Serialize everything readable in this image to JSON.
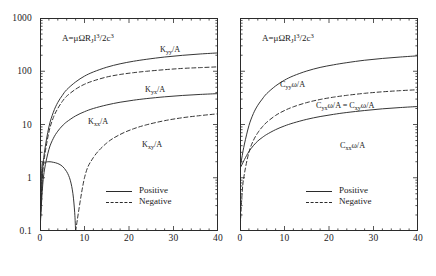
{
  "figure": {
    "annotation": {
      "prefix": "A=",
      "body": "μΩR",
      "sub1": "J",
      "var": "l",
      "sup1": "3",
      "mid": "/2c",
      "sup2": "3",
      "full": "A=μΩR_J l^3/2c^3"
    }
  },
  "axes": {
    "y_ticks": [
      "1000",
      "100",
      "10",
      "1",
      "0.1"
    ],
    "y_values": [
      1000,
      100,
      10,
      1,
      0.1
    ],
    "x_ticks": [
      "0",
      "10",
      "20",
      "30",
      "40"
    ],
    "x_values": [
      0,
      10,
      20,
      30,
      40
    ],
    "ylim": [
      0.1,
      1000
    ],
    "xlim": [
      0,
      40
    ],
    "yscale": "log",
    "xscale": "linear"
  },
  "legend": {
    "position": "bottom-center-right",
    "entries": [
      {
        "label": "Positive",
        "style": "solid"
      },
      {
        "label": "Negative",
        "style": "dashed"
      }
    ]
  },
  "panels": [
    {
      "id": "left",
      "labels": [
        {
          "name": "K_yy/A",
          "sym": "K",
          "sub": "yy",
          "suffix": "/A"
        },
        {
          "name": "K_yx/A",
          "sym": "K",
          "sub": "yx",
          "suffix": "/A"
        },
        {
          "name": "K_xx/A",
          "sym": "K",
          "sub": "xx",
          "suffix": "/A"
        },
        {
          "name": "K_xy/A",
          "sym": "K",
          "sub": "xy",
          "suffix": "/A"
        }
      ]
    },
    {
      "id": "right",
      "labels": [
        {
          "name": "C_yyω/A",
          "sym": "C",
          "sub": "yy",
          "suffix": "ω/A"
        },
        {
          "name": "C_yxω/A = C_xyω/A",
          "sym": "C",
          "sub": "yx",
          "suffix": "ω/A = C",
          "sub2": "xy",
          "suffix2": "ω/A"
        },
        {
          "name": "C_xxω/A",
          "sym": "C",
          "sub": "xx",
          "suffix": "ω/A"
        }
      ]
    }
  ],
  "chart_data": {
    "type": "line",
    "title": "",
    "xlabel": "",
    "ylabel": "",
    "xlim": [
      0,
      40
    ],
    "ylim": [
      0.1,
      1000
    ],
    "yscale": "log",
    "grid": false,
    "annotation": "A=μΩR_J l^3/2c^3",
    "legend": [
      "Positive",
      "Negative"
    ],
    "panels": [
      {
        "id": "left-panel",
        "x": [
          0,
          0.5,
          1,
          2,
          3,
          4,
          5,
          6,
          8,
          10,
          12,
          15,
          18,
          21,
          24,
          28,
          32,
          36,
          40
        ],
        "series": [
          {
            "name": "K_yy/A",
            "style": "solid",
            "sign": "positive",
            "values": [
              0.1,
              1.1,
              3.0,
              9.0,
              17,
              26,
              35,
              45,
              63,
              81,
              97,
              119,
              138,
              154,
              168,
              185,
              199,
              211,
              221
            ]
          },
          {
            "name": "K_yx/A",
            "style": "dashed",
            "sign": "negative",
            "values": [
              0.1,
              0.9,
              2.4,
              7.2,
              13.5,
              20,
              27,
              34,
              46,
              57,
              66,
              78,
              87,
              94,
              100,
              107,
              113,
              117,
              121
            ]
          },
          {
            "name": "K_xx/A",
            "style": "solid",
            "sign": "positive",
            "values": [
              0.1,
              0.55,
              1.4,
              3.4,
              5.5,
              7.5,
              9.4,
              11.2,
              14.5,
              17.4,
              20,
              23.3,
              26.2,
              28.6,
              30.7,
              33.1,
              35.1,
              36.7,
              38.0
            ]
          },
          {
            "name": "K_xy/A",
            "style": "dashed",
            "sign": "negative",
            "values": [
              null,
              null,
              null,
              null,
              null,
              null,
              null,
              null,
              0.1,
              1.0,
              2.4,
              4.5,
              6.5,
              8.3,
              9.9,
              11.8,
              13.4,
              14.7,
              15.9
            ]
          },
          {
            "name": "K_xy/A (positive branch)",
            "style": "solid",
            "sign": "positive",
            "x": [
              0,
              0.4,
              1,
              2,
              3,
              4,
              5,
              6,
              6.8,
              7.4,
              7.8,
              8.0
            ],
            "values": [
              0.1,
              1.5,
              1.9,
              2.0,
              1.95,
              1.85,
              1.65,
              1.3,
              0.9,
              0.5,
              0.22,
              0.1
            ]
          }
        ]
      },
      {
        "id": "right-panel",
        "x": [
          0,
          0.5,
          1,
          2,
          3,
          4,
          5,
          6,
          8,
          10,
          12,
          15,
          18,
          21,
          24,
          28,
          32,
          36,
          40
        ],
        "series": [
          {
            "name": "C_yyω/A",
            "style": "solid",
            "sign": "positive",
            "values": [
              1.5,
              2.6,
              4.3,
              9.5,
              16,
              23,
              30,
              38,
              53,
              68,
              82,
              101,
              118,
              132,
              145,
              161,
              174,
              185,
              195
            ]
          },
          {
            "name": "C_yxω/A = C_xyω/A",
            "style": "dashed",
            "sign": "negative",
            "values": [
              0.1,
              0.55,
              1.2,
              3.0,
              5.0,
              7.0,
              9.0,
              11.0,
              14.8,
              18.3,
              21.5,
              25.8,
              29.5,
              32.6,
              35.3,
              38.5,
              41.1,
              43.2,
              45.0
            ]
          },
          {
            "name": "C_xxω/A",
            "style": "solid",
            "sign": "positive",
            "values": [
              1.5,
              1.8,
              2.2,
              3.1,
              4.0,
              4.9,
              5.7,
              6.5,
              8.0,
              9.4,
              10.7,
              12.5,
              14.1,
              15.5,
              16.8,
              18.3,
              19.7,
              20.8,
              21.8
            ]
          }
        ]
      }
    ]
  }
}
